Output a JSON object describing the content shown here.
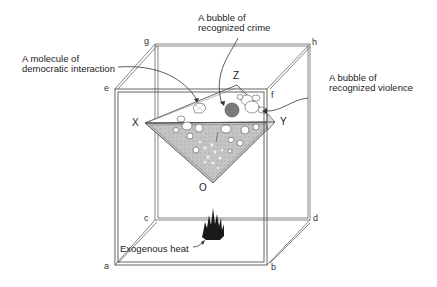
{
  "diagram": {
    "type": "3d-box-with-inverted-pyramid",
    "labels": {
      "molecule": [
        "A molecule of",
        "democratic interaction"
      ],
      "crime": [
        "A bubble of",
        "recognized crime"
      ],
      "violence": [
        "A bubble of",
        "recognized violence"
      ],
      "heat": "Exogenous heat"
    },
    "vertices": {
      "a": "a",
      "b": "b",
      "c": "c",
      "d": "d",
      "e": "e",
      "f": "f",
      "g": "g",
      "h": "h"
    },
    "pyramid_points": {
      "X": "X",
      "Y": "Y",
      "Z": "Z",
      "O": "O"
    },
    "colors": {
      "line": "#555555",
      "fill_shaded": "#bdbdbd",
      "crime_bubble": "#7a7a7a",
      "flame": "#1a1a1a"
    }
  }
}
